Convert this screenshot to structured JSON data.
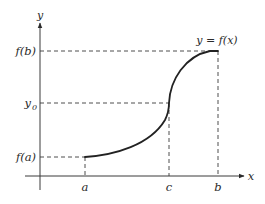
{
  "diagram": {
    "type": "function-graph",
    "axes": {
      "x_label": "x",
      "y_label": "y"
    },
    "curve_label": "y = f(x)",
    "x_ticks": [
      {
        "label": "a",
        "x": 85
      },
      {
        "label": "c",
        "x": 169
      },
      {
        "label": "b",
        "x": 218
      }
    ],
    "y_ticks": [
      {
        "label": "f(b)",
        "y": 51
      },
      {
        "label": "y",
        "sub": "0",
        "y": 103
      },
      {
        "label": "f(a)",
        "y": 157
      }
    ],
    "labels": {
      "fb": "f(b)",
      "y0_main": "y",
      "y0_sub": "0",
      "fa": "f(a)",
      "a": "a",
      "c": "c",
      "b": "b",
      "x_axis": "x",
      "y_axis": "y",
      "curve": "y = f(x)"
    },
    "colors": {
      "line": "#3a3a3a",
      "curve": "#222222",
      "text": "#2a2a2a",
      "background": "#ffffff"
    }
  }
}
